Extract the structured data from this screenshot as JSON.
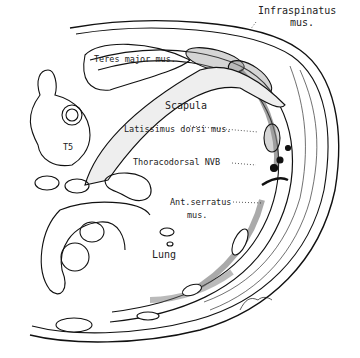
{
  "figure": {
    "type": "anatomical cross-section illustration",
    "labels": {
      "infraspinatus_line1": "Infraspinatus",
      "infraspinatus_line2": "mus.",
      "teres_major": "Teres major mus.",
      "scapula": "Scapula",
      "latissimus": "Latissimus dorsi mus.",
      "t5": "T5",
      "thoracodorsal": "Thoracodorsal NVB",
      "ant_serratus_line1": "Ant.serratus",
      "ant_serratus_line2": "mus.",
      "lung": "Lung"
    }
  }
}
